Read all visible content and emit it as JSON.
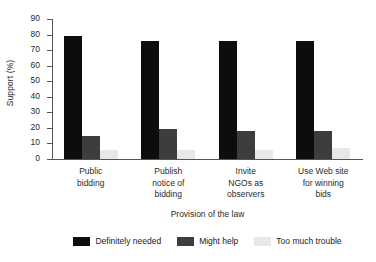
{
  "chart_data": {
    "type": "bar",
    "title": "",
    "subtitle": "",
    "xlabel": "Provision of the law",
    "ylabel": "Support (%)",
    "categories": [
      "Public\nbidding",
      "Publish\nnotice of\nbidding",
      "Invite\nNGOs as\nobservers",
      "Use Web site\nfor winning\nbids"
    ],
    "series": [
      {
        "name": "Definitely needed",
        "color": "#0d0d0d",
        "values": [
          79,
          76,
          76,
          76
        ]
      },
      {
        "name": "Might help",
        "color": "#3d3d3d",
        "values": [
          15,
          19,
          18,
          18
        ]
      },
      {
        "name": "Too much trouble",
        "color": "#e8e8e8",
        "values": [
          6,
          6,
          6,
          7
        ]
      }
    ],
    "ylim": [
      0,
      90
    ],
    "yticks": [
      0,
      10,
      20,
      30,
      40,
      50,
      60,
      70,
      80,
      90
    ],
    "ytick_labels": [
      "0",
      "10",
      "20",
      "30",
      "40",
      "50",
      "60",
      "70",
      "80",
      "90"
    ],
    "grid": false,
    "legend_position": "bottom-center",
    "bar_layout": "grouped-adjacent"
  }
}
